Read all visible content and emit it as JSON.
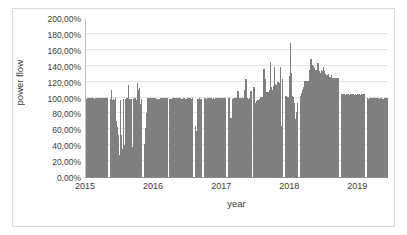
{
  "chart_data": {
    "type": "bar",
    "title": "",
    "subtitle": "",
    "xlabel": "year",
    "ylabel": "power flow",
    "legend": [],
    "legend_position": "none",
    "grid": true,
    "bar_color": "#7f7f7f",
    "plot_border_color": "#bfbfbf",
    "gridline_color": "#e4e4e4",
    "frame_color": "#d9d9d9",
    "xlim": [
      2015.0,
      2019.45
    ],
    "ylim": [
      0,
      2.0
    ],
    "y_ticks": [
      0,
      0.2,
      0.4,
      0.6,
      0.8,
      1.0,
      1.2,
      1.4,
      1.6,
      1.8,
      2.0
    ],
    "y_tick_labels": [
      "0,00%",
      "20,00%",
      "40,00%",
      "60,00%",
      "80,00%",
      "100,00%",
      "120,00%",
      "140,00%",
      "160,00%",
      "180,00%",
      "200,00%"
    ],
    "x_ticks": [
      2015,
      2016,
      2017,
      2018,
      2019
    ],
    "x_tick_labels": [
      "2015",
      "2016",
      "2017",
      "2018",
      "2019"
    ],
    "series": [
      {
        "name": "power flow",
        "note": "Dense daily/near-daily time series of power flow as percent of nominal. Baseline plateau near 100% with outage gaps (zero-width white bands), downward dips and upward spikes; peak ~170% in mid 2018.",
        "points": [
          {
            "x": 2015.0,
            "y": 1.0
          },
          {
            "x": 2015.01,
            "y": 1.0
          },
          {
            "x": 2015.02,
            "y": 1.0
          },
          {
            "x": 2015.03,
            "y": 1.0
          },
          {
            "x": 2015.04,
            "y": 1.0
          },
          {
            "x": 2015.05,
            "y": 1.0
          },
          {
            "x": 2015.06,
            "y": 1.0
          },
          {
            "x": 2015.07,
            "y": 1.0
          },
          {
            "x": 2015.08,
            "y": 1.0
          },
          {
            "x": 2015.09,
            "y": 1.0
          },
          {
            "x": 2015.1,
            "y": 1.0
          },
          {
            "x": 2015.11,
            "y": 1.0
          },
          {
            "x": 2015.12,
            "y": 1.0
          },
          {
            "x": 2015.13,
            "y": 1.0
          },
          {
            "x": 2015.14,
            "y": 1.0
          },
          {
            "x": 2015.15,
            "y": 1.0
          },
          {
            "x": 2015.16,
            "y": 1.0
          },
          {
            "x": 2015.17,
            "y": 1.0
          },
          {
            "x": 2015.18,
            "y": 1.0
          },
          {
            "x": 2015.19,
            "y": 1.0
          },
          {
            "x": 2015.2,
            "y": 1.0
          },
          {
            "x": 2015.21,
            "y": 1.0
          },
          {
            "x": 2015.22,
            "y": 0.0
          },
          {
            "x": 2015.23,
            "y": 0.0
          },
          {
            "x": 2015.24,
            "y": 1.0
          },
          {
            "x": 2015.25,
            "y": 0.62
          },
          {
            "x": 2015.26,
            "y": 1.1
          },
          {
            "x": 2015.27,
            "y": 0.4
          },
          {
            "x": 2015.28,
            "y": 1.15
          },
          {
            "x": 2015.29,
            "y": 0.55
          },
          {
            "x": 2015.3,
            "y": 1.05
          },
          {
            "x": 2015.31,
            "y": 1.02
          },
          {
            "x": 2015.32,
            "y": 1.08
          },
          {
            "x": 2015.33,
            "y": 1.0
          },
          {
            "x": 2015.34,
            "y": 1.06
          },
          {
            "x": 2015.35,
            "y": 1.0
          },
          {
            "x": 2015.36,
            "y": 1.03
          },
          {
            "x": 2015.37,
            "y": 1.0
          },
          {
            "x": 2015.38,
            "y": 1.0
          },
          {
            "x": 2015.45,
            "y": 1.0
          },
          {
            "x": 2015.5,
            "y": 1.0
          },
          {
            "x": 2015.55,
            "y": 1.0
          },
          {
            "x": 2015.6,
            "y": 0.0
          },
          {
            "x": 2015.62,
            "y": 0.7
          },
          {
            "x": 2015.65,
            "y": 1.0
          },
          {
            "x": 2015.7,
            "y": 1.0
          },
          {
            "x": 2015.75,
            "y": 1.0
          },
          {
            "x": 2015.8,
            "y": 1.0
          },
          {
            "x": 2015.85,
            "y": 1.0
          },
          {
            "x": 2015.9,
            "y": 1.0
          },
          {
            "x": 2015.95,
            "y": 1.0
          },
          {
            "x": 2016.0,
            "y": 1.0
          },
          {
            "x": 2016.05,
            "y": 1.0
          },
          {
            "x": 2016.1,
            "y": 1.0
          },
          {
            "x": 2016.15,
            "y": 1.0
          },
          {
            "x": 2016.2,
            "y": 1.02
          },
          {
            "x": 2016.25,
            "y": 1.0
          },
          {
            "x": 2016.3,
            "y": 1.05
          },
          {
            "x": 2016.35,
            "y": 1.0
          },
          {
            "x": 2016.4,
            "y": 1.08
          },
          {
            "x": 2016.45,
            "y": 0.0
          },
          {
            "x": 2016.48,
            "y": 0.62
          },
          {
            "x": 2016.52,
            "y": 1.0
          },
          {
            "x": 2016.55,
            "y": 1.0
          },
          {
            "x": 2016.6,
            "y": 1.0
          },
          {
            "x": 2016.65,
            "y": 1.0
          },
          {
            "x": 2016.7,
            "y": 1.0
          },
          {
            "x": 2016.75,
            "y": 1.0
          },
          {
            "x": 2016.8,
            "y": 1.0
          },
          {
            "x": 2016.85,
            "y": 1.0
          },
          {
            "x": 2016.9,
            "y": 1.0
          },
          {
            "x": 2016.95,
            "y": 1.0
          },
          {
            "x": 2017.0,
            "y": 1.0
          },
          {
            "x": 2017.05,
            "y": 1.0
          },
          {
            "x": 2017.1,
            "y": 1.0
          },
          {
            "x": 2017.15,
            "y": 1.0
          },
          {
            "x": 2017.2,
            "y": 1.0
          },
          {
            "x": 2017.25,
            "y": 1.05
          },
          {
            "x": 2017.3,
            "y": 1.0
          },
          {
            "x": 2017.35,
            "y": 0.0
          },
          {
            "x": 2017.38,
            "y": 0.78
          },
          {
            "x": 2017.42,
            "y": 1.0
          },
          {
            "x": 2017.45,
            "y": 1.0
          },
          {
            "x": 2017.5,
            "y": 1.0
          },
          {
            "x": 2017.55,
            "y": 1.12
          },
          {
            "x": 2017.6,
            "y": 1.0
          },
          {
            "x": 2017.65,
            "y": 1.0
          },
          {
            "x": 2017.7,
            "y": 1.0
          },
          {
            "x": 2017.75,
            "y": 1.0
          },
          {
            "x": 2017.8,
            "y": 1.18
          },
          {
            "x": 2017.85,
            "y": 1.0
          },
          {
            "x": 2017.9,
            "y": 1.0
          },
          {
            "x": 2017.95,
            "y": 1.0
          },
          {
            "x": 2018.0,
            "y": 1.2
          },
          {
            "x": 2018.03,
            "y": 1.12
          },
          {
            "x": 2018.06,
            "y": 1.25
          },
          {
            "x": 2018.09,
            "y": 1.05
          },
          {
            "x": 2018.12,
            "y": 1.3
          },
          {
            "x": 2018.15,
            "y": 1.0
          },
          {
            "x": 2018.18,
            "y": 1.35
          },
          {
            "x": 2018.21,
            "y": 1.15
          },
          {
            "x": 2018.24,
            "y": 1.4
          },
          {
            "x": 2018.27,
            "y": 1.7
          },
          {
            "x": 2018.3,
            "y": 1.45
          },
          {
            "x": 2018.33,
            "y": 1.22
          },
          {
            "x": 2018.36,
            "y": 1.05
          },
          {
            "x": 2018.4,
            "y": 1.28
          },
          {
            "x": 2018.44,
            "y": 1.32
          },
          {
            "x": 2018.48,
            "y": 1.42
          },
          {
            "x": 2018.52,
            "y": 1.38
          },
          {
            "x": 2018.56,
            "y": 1.4
          },
          {
            "x": 2018.6,
            "y": 1.35
          },
          {
            "x": 2018.64,
            "y": 1.3
          },
          {
            "x": 2018.68,
            "y": 1.3
          },
          {
            "x": 2018.72,
            "y": 1.28
          },
          {
            "x": 2018.76,
            "y": 1.25
          },
          {
            "x": 2018.8,
            "y": 1.2
          },
          {
            "x": 2018.84,
            "y": 1.18
          },
          {
            "x": 2018.88,
            "y": 1.15
          },
          {
            "x": 2018.92,
            "y": 0.0
          },
          {
            "x": 2018.95,
            "y": 1.05
          },
          {
            "x": 2019.0,
            "y": 1.02
          },
          {
            "x": 2019.05,
            "y": 1.0
          },
          {
            "x": 2019.1,
            "y": 1.0
          },
          {
            "x": 2019.15,
            "y": 1.0
          },
          {
            "x": 2019.2,
            "y": 1.0
          },
          {
            "x": 2019.25,
            "y": 1.0
          },
          {
            "x": 2019.3,
            "y": 1.0
          },
          {
            "x": 2019.35,
            "y": 1.0
          }
        ]
      }
    ],
    "segments": [
      {
        "start": 0.0,
        "end": 0.072,
        "top": 1.0,
        "profile": "flat"
      },
      {
        "start": 0.079,
        "end": 0.185,
        "top": 1.0,
        "profile": "spiky-dips"
      },
      {
        "start": 0.192,
        "end": 0.268,
        "top": 1.0,
        "profile": "flat-low-start"
      },
      {
        "start": 0.275,
        "end": 0.352,
        "top": 1.0,
        "profile": "flat-small-spikes"
      },
      {
        "start": 0.359,
        "end": 0.382,
        "top": 1.0,
        "profile": "narrow-deep-dip"
      },
      {
        "start": 0.389,
        "end": 0.462,
        "top": 1.0,
        "profile": "flat"
      },
      {
        "start": 0.469,
        "end": 0.545,
        "top": 1.0,
        "profile": "flat-spikes"
      },
      {
        "start": 0.552,
        "end": 0.65,
        "top": 1.15,
        "profile": "rising-spikes"
      },
      {
        "start": 0.657,
        "end": 0.7,
        "top": 1.7,
        "profile": "tall-spike"
      },
      {
        "start": 0.707,
        "end": 0.835,
        "top": 1.4,
        "profile": "high-plateau"
      },
      {
        "start": 0.842,
        "end": 0.92,
        "top": 1.05,
        "profile": "flat"
      },
      {
        "start": 0.927,
        "end": 1.0,
        "top": 1.0,
        "profile": "flat"
      }
    ]
  },
  "axes": {
    "y_title": "power flow",
    "x_title": "year"
  }
}
